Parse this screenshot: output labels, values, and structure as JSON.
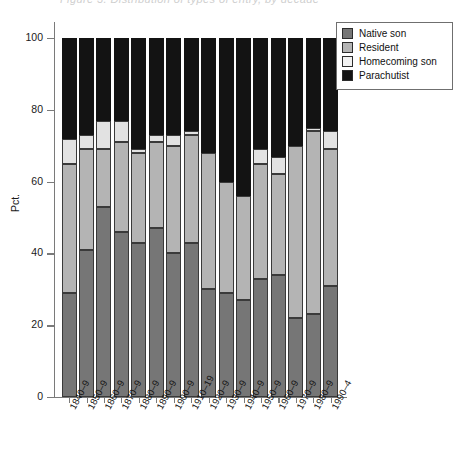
{
  "title_faint": "Figure 3.  Distribution of types of entry, by decade",
  "axis": {
    "y_label": "Pct.",
    "y_ticks": [
      "100",
      "80",
      "60",
      "40",
      "20",
      "0"
    ],
    "y_min": 0,
    "y_max": 100
  },
  "legend": {
    "items": [
      {
        "label": "Native son",
        "key": "native",
        "color": "#767676"
      },
      {
        "label": "Resident",
        "key": "resident",
        "color": "#b4b4b4"
      },
      {
        "label": "Homecoming son",
        "key": "homecoming",
        "color": "#f2f2f2"
      },
      {
        "label": "Parachutist",
        "key": "parachutist",
        "color": "#131313"
      }
    ]
  },
  "chart_data": {
    "type": "bar",
    "title": "",
    "xlabel": "",
    "ylabel": "Pct.",
    "ylim": [
      0,
      100
    ],
    "grid": false,
    "stacked": true,
    "legend_position": "top-right",
    "categories": [
      "1840–9",
      "1850–9",
      "1860–9",
      "1870–9",
      "1880–9",
      "1890–9",
      "1900–9",
      "1910–19",
      "1920–9",
      "1930–9",
      "1940–9",
      "1950–9",
      "1960–9",
      "1970–9",
      "1980–9",
      "1990–4"
    ],
    "series": [
      {
        "name": "Native son",
        "color": "#767676",
        "values": [
          29,
          41,
          53,
          46,
          43,
          47,
          40,
          43,
          30,
          29,
          27,
          33,
          34,
          22,
          23,
          31
        ]
      },
      {
        "name": "Resident",
        "color": "#b4b4b4",
        "values": [
          36,
          28,
          16,
          25,
          25,
          24,
          30,
          30,
          38,
          31,
          29,
          32,
          28,
          48,
          51,
          38
        ]
      },
      {
        "name": "Homecoming son",
        "color": "#f2f2f2",
        "values": [
          7,
          4,
          8,
          6,
          1,
          2,
          3,
          1,
          0,
          0,
          0,
          4,
          5,
          0,
          1,
          5
        ]
      },
      {
        "name": "Parachutist",
        "color": "#131313",
        "values": [
          28,
          27,
          23,
          23,
          31,
          27,
          27,
          26,
          32,
          40,
          44,
          31,
          33,
          30,
          25,
          26
        ]
      }
    ]
  }
}
